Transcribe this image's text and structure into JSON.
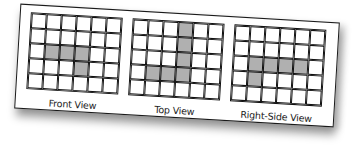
{
  "diagram": {
    "grid_rows": 5,
    "grid_cols": 6,
    "shade_color": "#b0b0b0",
    "views": [
      {
        "label": "Front View",
        "shaded": [
          [
            2,
            1
          ],
          [
            2,
            2
          ],
          [
            2,
            3
          ],
          [
            3,
            3
          ]
        ]
      },
      {
        "label": "Top View",
        "shaded": [
          [
            0,
            3
          ],
          [
            1,
            3
          ],
          [
            2,
            3
          ],
          [
            3,
            1
          ],
          [
            3,
            2
          ],
          [
            3,
            3
          ]
        ]
      },
      {
        "label": "Right-Side View",
        "shaded": [
          [
            2,
            1
          ],
          [
            2,
            2
          ],
          [
            2,
            3
          ],
          [
            2,
            4
          ],
          [
            3,
            1
          ]
        ]
      }
    ]
  }
}
